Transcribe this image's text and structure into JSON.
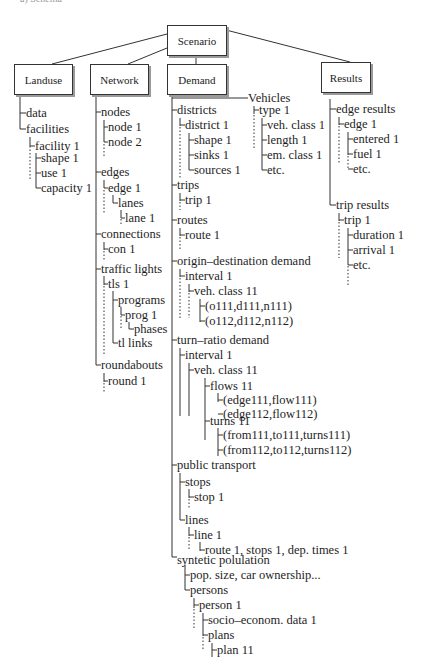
{
  "caption": "a) Schema",
  "boxes": {
    "scenario": "Scenario",
    "landuse": "Landuse",
    "network": "Network",
    "demand": "Demand",
    "results": "Results"
  },
  "landuse": [
    "data",
    "facilities",
    "facility 1",
    "shape 1",
    "use 1",
    "capacity 1"
  ],
  "network": [
    "nodes",
    "node 1",
    "node 2",
    "edges",
    "edge 1",
    "lanes",
    "lane 1",
    "connections",
    "con 1",
    "traffic lights",
    "tls 1",
    "programs",
    "prog 1",
    "phases",
    "tl links",
    "roundabouts",
    "round 1"
  ],
  "vehicles": [
    "Vehicles",
    "type 1",
    "veh. class 1",
    "length 1",
    "em. class 1",
    "etc."
  ],
  "demand": [
    "districts",
    "district 1",
    "shape 1",
    "sinks 1",
    "sources 1",
    "trips",
    "trip 1",
    "routes",
    "route 1",
    "origin–destination demand",
    "interval 1",
    "veh. class 11",
    "(o111,d111,n111)",
    "(o112,d112,n112)",
    "turn–ratio demand",
    "interval 1",
    "veh. class 11",
    "flows 11",
    "(edge111,flow111)",
    "(edge112,flow112)",
    "turns 11",
    "(from111,to111,turns111)",
    "(from112,to112,turns112)",
    "public transport",
    "stops",
    "stop 1",
    "lines",
    "line 1",
    "route 1, stops 1, dep. times 1",
    "syntetic polulation",
    "pop. size, car ownership...",
    "persons",
    "person 1",
    "socio–econom. data 1",
    "plans",
    "plan 11"
  ],
  "results": [
    "edge results",
    "edge 1",
    "entered 1",
    "fuel 1",
    "etc.",
    "trip results",
    "trip 1",
    "duration 1",
    "arrival 1",
    "etc."
  ]
}
